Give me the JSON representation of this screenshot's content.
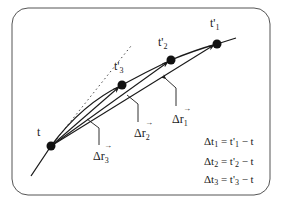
{
  "diagram": {
    "frame": {
      "x": 12,
      "y": 8,
      "width": 258,
      "height": 187,
      "radius": 16,
      "stroke": "#555555"
    },
    "curve_color": "#1a1a1a",
    "points": [
      {
        "id": "t",
        "label": "t",
        "sub": "",
        "x": 51,
        "y": 146
      },
      {
        "id": "t3p",
        "label": "t'",
        "sub": "3",
        "x": 122,
        "y": 85
      },
      {
        "id": "t2p",
        "label": "t'",
        "sub": "2",
        "x": 171,
        "y": 60
      },
      {
        "id": "t1p",
        "label": "t'",
        "sub": "1",
        "x": 217,
        "y": 44
      }
    ],
    "vectors": [
      {
        "id": "dr1",
        "label": "Δr",
        "sub": "1",
        "arrow": "→"
      },
      {
        "id": "dr2",
        "label": "Δr",
        "sub": "2",
        "arrow": "→"
      },
      {
        "id": "dr3",
        "label": "Δr",
        "sub": "3",
        "arrow": "→"
      }
    ],
    "tangent": {
      "style": "dotted",
      "label": "tangent at t"
    },
    "equations": [
      {
        "lhs": "Δt",
        "lhs_sub": "1",
        "eq": " = t'",
        "rhs_sub": "1",
        "tail": " − t"
      },
      {
        "lhs": "Δt",
        "lhs_sub": "2",
        "eq": " = t'",
        "rhs_sub": "2",
        "tail": " − t"
      },
      {
        "lhs": "Δt",
        "lhs_sub": "3",
        "eq": " = t'",
        "rhs_sub": "3",
        "tail": " − t"
      }
    ]
  }
}
